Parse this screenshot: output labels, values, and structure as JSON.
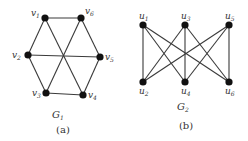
{
  "figures": [
    {
      "id": "G1",
      "graph_label": {
        "base": "G",
        "sub": "1"
      },
      "caption": "(a)",
      "nodes": [
        {
          "id": "v1",
          "base": "v",
          "sub": "1"
        },
        {
          "id": "v2",
          "base": "v",
          "sub": "2"
        },
        {
          "id": "v3",
          "base": "v",
          "sub": "3"
        },
        {
          "id": "v4",
          "base": "v",
          "sub": "4"
        },
        {
          "id": "v5",
          "base": "v",
          "sub": "5"
        },
        {
          "id": "v6",
          "base": "v",
          "sub": "6"
        }
      ],
      "edges": [
        [
          "v1",
          "v6"
        ],
        [
          "v1",
          "v2"
        ],
        [
          "v1",
          "v4"
        ],
        [
          "v6",
          "v3"
        ],
        [
          "v6",
          "v5"
        ],
        [
          "v2",
          "v5"
        ],
        [
          "v2",
          "v3"
        ],
        [
          "v3",
          "v4"
        ],
        [
          "v4",
          "v5"
        ]
      ]
    },
    {
      "id": "G2",
      "graph_label": {
        "base": "G",
        "sub": "2"
      },
      "caption": "(b)",
      "nodes": [
        {
          "id": "u1",
          "base": "u",
          "sub": "1"
        },
        {
          "id": "u2",
          "base": "u",
          "sub": "2"
        },
        {
          "id": "u3",
          "base": "u",
          "sub": "3"
        },
        {
          "id": "u4",
          "base": "u",
          "sub": "4"
        },
        {
          "id": "u5",
          "base": "u",
          "sub": "5"
        },
        {
          "id": "u6",
          "base": "u",
          "sub": "6"
        }
      ],
      "edges": [
        [
          "u1",
          "u2"
        ],
        [
          "u1",
          "u4"
        ],
        [
          "u1",
          "u6"
        ],
        [
          "u3",
          "u2"
        ],
        [
          "u3",
          "u4"
        ],
        [
          "u3",
          "u6"
        ],
        [
          "u5",
          "u2"
        ],
        [
          "u5",
          "u4"
        ],
        [
          "u5",
          "u6"
        ]
      ]
    }
  ]
}
